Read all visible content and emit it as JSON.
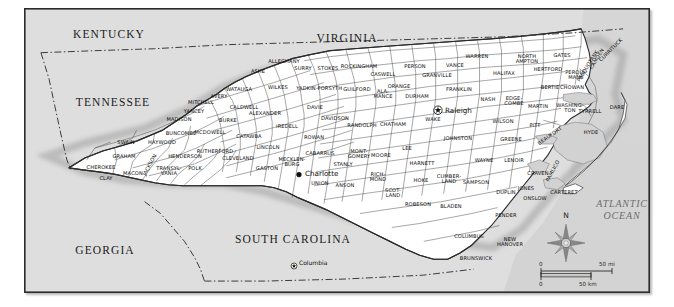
{
  "map": {
    "title": "North Carolina county map",
    "background_color": "#dedede",
    "land_color": "#ffffff",
    "water_color": "#d2d2d2",
    "border_color": "#2b2b2b"
  },
  "states": [
    {
      "name": "KENTUCKY",
      "x": 84,
      "y": 25
    },
    {
      "name": "VIRGINIA",
      "x": 322,
      "y": 29
    },
    {
      "name": "TENNESSEE",
      "x": 88,
      "y": 93
    },
    {
      "name": "GEORGIA",
      "x": 80,
      "y": 241
    },
    {
      "name": "SOUTH CAROLINA",
      "x": 268,
      "y": 230
    }
  ],
  "ocean": {
    "line1": "ATLANTIC",
    "line2": "OCEAN",
    "x": 597,
    "y": 201
  },
  "cities": [
    {
      "name": "Raleigh",
      "marker": "star-circle-marker",
      "mx": 413,
      "my": 101,
      "tx": 420,
      "ty": 101,
      "size": "large"
    },
    {
      "name": "Charlotte",
      "marker": "dot-marker",
      "mx": 274,
      "my": 164,
      "tx": 280,
      "ty": 164,
      "size": "large"
    },
    {
      "name": "Columbia",
      "marker": "star-circle-marker-small",
      "mx": 269,
      "my": 256,
      "tx": 274,
      "ty": 253,
      "size": "small"
    }
  ],
  "compass": {
    "label": "N",
    "name": "compass-rose"
  },
  "scale": {
    "miles": {
      "zero": "0",
      "value": "50 mi"
    },
    "kilometers": {
      "zero": "0",
      "value": "50 km"
    }
  },
  "counties": [
    {
      "name": "CHEROKEE",
      "x": 76,
      "y": 159
    },
    {
      "name": "CLAY",
      "x": 81,
      "y": 170
    },
    {
      "name": "GRAHAM",
      "x": 99,
      "y": 148
    },
    {
      "name": "MACON",
      "x": 108,
      "y": 165
    },
    {
      "name": "SWAIN",
      "x": 101,
      "y": 134
    },
    {
      "name": "JACKSON",
      "x": 125,
      "y": 156,
      "rot": -62
    },
    {
      "name": "HAYWOOD",
      "x": 137,
      "y": 134
    },
    {
      "name": "TRANSYL-|VANIA",
      "x": 144,
      "y": 162
    },
    {
      "name": "MADISON",
      "x": 154,
      "y": 111
    },
    {
      "name": "BUNCOMBE",
      "x": 156,
      "y": 125
    },
    {
      "name": "HENDERSON",
      "x": 160,
      "y": 148
    },
    {
      "name": "POLK",
      "x": 170,
      "y": 160
    },
    {
      "name": "YANCEY",
      "x": 169,
      "y": 103
    },
    {
      "name": "MITCHELL",
      "x": 176,
      "y": 94
    },
    {
      "name": "MCDOWELL",
      "x": 185,
      "y": 124
    },
    {
      "name": "RUTHERFORD",
      "x": 190,
      "y": 143
    },
    {
      "name": "AVERY",
      "x": 194,
      "y": 88
    },
    {
      "name": "BURKE",
      "x": 203,
      "y": 112
    },
    {
      "name": "CLEVELAND",
      "x": 213,
      "y": 150
    },
    {
      "name": "CALDWELL",
      "x": 219,
      "y": 99
    },
    {
      "name": "WATAUGA",
      "x": 214,
      "y": 81
    },
    {
      "name": "CATAWBA",
      "x": 224,
      "y": 128
    },
    {
      "name": "ASHE",
      "x": 233,
      "y": 63
    },
    {
      "name": "ALEXANDER",
      "x": 240,
      "y": 105
    },
    {
      "name": "LINCOLN",
      "x": 243,
      "y": 139
    },
    {
      "name": "GASTON",
      "x": 242,
      "y": 160
    },
    {
      "name": "ALLEGHANY",
      "x": 259,
      "y": 53
    },
    {
      "name": "WILKES",
      "x": 253,
      "y": 79
    },
    {
      "name": "IREDELL",
      "x": 262,
      "y": 118
    },
    {
      "name": "MECKLEN-|BURG",
      "x": 267,
      "y": 153
    },
    {
      "name": "SURRY",
      "x": 278,
      "y": 60
    },
    {
      "name": "YADKIN",
      "x": 281,
      "y": 80
    },
    {
      "name": "DAVIE",
      "x": 290,
      "y": 99
    },
    {
      "name": "ROWAN",
      "x": 289,
      "y": 129
    },
    {
      "name": "CABARRUS",
      "x": 295,
      "y": 145
    },
    {
      "name": "UNION",
      "x": 295,
      "y": 175
    },
    {
      "name": "STOKES",
      "x": 303,
      "y": 60
    },
    {
      "name": "FORSYTH",
      "x": 305,
      "y": 80
    },
    {
      "name": "DAVIDSON",
      "x": 310,
      "y": 110
    },
    {
      "name": "STANLY",
      "x": 318,
      "y": 156
    },
    {
      "name": "ANSON",
      "x": 320,
      "y": 177
    },
    {
      "name": "ROCKINGHAM",
      "x": 334,
      "y": 58
    },
    {
      "name": "GUILFORD",
      "x": 332,
      "y": 81
    },
    {
      "name": "MONT-|GOMERY",
      "x": 334,
      "y": 145
    },
    {
      "name": "RANDOLPH",
      "x": 337,
      "y": 117
    },
    {
      "name": "CASWELL",
      "x": 358,
      "y": 66
    },
    {
      "name": "ALA-|MANCE",
      "x": 358,
      "y": 85
    },
    {
      "name": "RICH-|MOND",
      "x": 353,
      "y": 168
    },
    {
      "name": "MOORE",
      "x": 356,
      "y": 147
    },
    {
      "name": "CHATHAM",
      "x": 368,
      "y": 116
    },
    {
      "name": "ORANGE",
      "x": 374,
      "y": 78
    },
    {
      "name": "LEE",
      "x": 382,
      "y": 140
    },
    {
      "name": "SCOT-|LAND",
      "x": 368,
      "y": 184
    },
    {
      "name": "PERSON",
      "x": 390,
      "y": 58
    },
    {
      "name": "DURHAM",
      "x": 392,
      "y": 88
    },
    {
      "name": "HARNETT",
      "x": 397,
      "y": 155
    },
    {
      "name": "WAKE",
      "x": 408,
      "y": 111
    },
    {
      "name": "GRANVILLE",
      "x": 412,
      "y": 67
    },
    {
      "name": "HOKE",
      "x": 396,
      "y": 172
    },
    {
      "name": "ROBESON",
      "x": 393,
      "y": 196
    },
    {
      "name": "VANCE",
      "x": 430,
      "y": 57
    },
    {
      "name": "FRANKLIN",
      "x": 434,
      "y": 81
    },
    {
      "name": "CUMBER-|LAND",
      "x": 424,
      "y": 170
    },
    {
      "name": "JOHNSTON",
      "x": 433,
      "y": 130
    },
    {
      "name": "BLADEN",
      "x": 426,
      "y": 198
    },
    {
      "name": "WARREN",
      "x": 452,
      "y": 48
    },
    {
      "name": "SAMPSON",
      "x": 451,
      "y": 174
    },
    {
      "name": "NASH",
      "x": 463,
      "y": 91
    },
    {
      "name": "WAYNE",
      "x": 459,
      "y": 152
    },
    {
      "name": "COLUMBUS",
      "x": 444,
      "y": 228
    },
    {
      "name": "HALIFAX",
      "x": 479,
      "y": 65
    },
    {
      "name": "WILSON",
      "x": 478,
      "y": 113
    },
    {
      "name": "EDGE-|COMBE",
      "x": 489,
      "y": 92
    },
    {
      "name": "DUPLIN",
      "x": 481,
      "y": 184
    },
    {
      "name": "GREENE",
      "x": 486,
      "y": 131
    },
    {
      "name": "LENOIR",
      "x": 489,
      "y": 152
    },
    {
      "name": "PENDER",
      "x": 481,
      "y": 207
    },
    {
      "name": "NORTH|AMPTON",
      "x": 502,
      "y": 50
    },
    {
      "name": "BRUNSWICK",
      "x": 451,
      "y": 250
    },
    {
      "name": "NEW|HANOVER",
      "x": 485,
      "y": 233
    },
    {
      "name": "PITT",
      "x": 510,
      "y": 117
    },
    {
      "name": "MARTIN",
      "x": 513,
      "y": 98
    },
    {
      "name": "HERTFORD",
      "x": 523,
      "y": 61
    },
    {
      "name": "GATES",
      "x": 537,
      "y": 47
    },
    {
      "name": "BERTIE",
      "x": 525,
      "y": 79
    },
    {
      "name": "CRAVEN",
      "x": 513,
      "y": 165
    },
    {
      "name": "JONES",
      "x": 501,
      "y": 180
    },
    {
      "name": "ONSLOW",
      "x": 510,
      "y": 190
    },
    {
      "name": "BEAUFORT",
      "x": 525,
      "y": 127,
      "rot": -35
    },
    {
      "name": "WASHING-|TON",
      "x": 545,
      "y": 99
    },
    {
      "name": "CHOWAN",
      "x": 547,
      "y": 79
    },
    {
      "name": "PERQUI-|MANS",
      "x": 551,
      "y": 66
    },
    {
      "name": "PASQUOTANK",
      "x": 563,
      "y": 57,
      "rot": -58
    },
    {
      "name": "CAMDEN",
      "x": 572,
      "y": 50,
      "rot": -58
    },
    {
      "name": "CURRITUCK",
      "x": 586,
      "y": 41,
      "rot": -45
    },
    {
      "name": "TYRRELL",
      "x": 565,
      "y": 103
    },
    {
      "name": "DARE",
      "x": 592,
      "y": 99
    },
    {
      "name": "HYDE",
      "x": 566,
      "y": 124
    },
    {
      "name": "PAMLICO",
      "x": 528,
      "y": 162,
      "rot": -62
    },
    {
      "name": "CARTERET",
      "x": 539,
      "y": 184
    }
  ]
}
